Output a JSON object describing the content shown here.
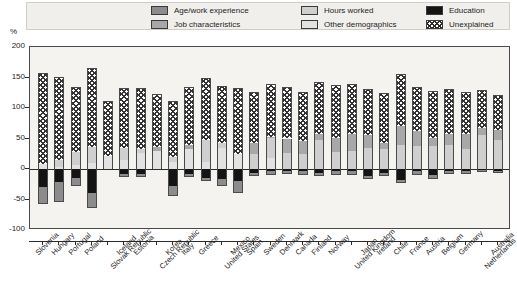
{
  "axis": {
    "unit_label": "%",
    "y_ticks": [
      "200",
      "150",
      "100",
      "50",
      "0",
      "-50",
      "-100"
    ]
  },
  "legend": {
    "items": [
      {
        "key": "age",
        "label": "Age/work experience",
        "swatch": "sw-age",
        "col": 0,
        "row": 0
      },
      {
        "key": "job",
        "label": "Job characteristics",
        "swatch": "sw-job",
        "col": 0,
        "row": 1
      },
      {
        "key": "hours",
        "label": "Hours worked",
        "swatch": "sw-hours",
        "col": 1,
        "row": 0
      },
      {
        "key": "other",
        "label": "Other demographics",
        "swatch": "sw-other",
        "col": 1,
        "row": 1
      },
      {
        "key": "education",
        "label": "Education",
        "swatch": "sw-edu",
        "col": 2,
        "row": 0
      },
      {
        "key": "unexplained",
        "label": "Unexplained",
        "swatch": "sw-unex",
        "col": 2,
        "row": 1
      }
    ]
  },
  "colors": {
    "age": "#8c8c8c",
    "job": "#a8a8a8",
    "hours": "#cfcfcf",
    "other": "#e2e2e2",
    "education": "#141414",
    "unexplained": "#ffffff",
    "plot_background": "#f4f3f0",
    "legend_background": "#f0efec",
    "axis": "#2b2b2b"
  },
  "chart_data": {
    "type": "bar",
    "stacked": true,
    "title": "",
    "subtitle": "",
    "xlabel": "",
    "ylabel": "%",
    "ylim": [
      -100,
      200
    ],
    "ytick_step": 50,
    "grid": false,
    "legend_position": "top",
    "series_order": [
      "age",
      "job",
      "hours",
      "other",
      "education",
      "unexplained"
    ],
    "series_labels": {
      "age": "Age/work experience",
      "job": "Job characteristics",
      "hours": "Hours worked",
      "other": "Other demographics",
      "education": "Education",
      "unexplained": "Unexplained"
    },
    "categories": [
      "Slovenia",
      "Hungary",
      "Portugal",
      "Poland",
      "Slovak Republic",
      "Iceland",
      "Estonia",
      "Czech Republic",
      "Korea",
      "Italy",
      "Greece",
      "United States",
      "Mexico",
      "Spain",
      "Sweden",
      "Denmark",
      "Canada",
      "Finland",
      "Norway",
      "United Kingdom",
      "Japan",
      "Ireland",
      "Chile",
      "France",
      "Austria",
      "Belgium",
      "Germany",
      "Netherlands",
      "Australia"
    ],
    "series": [
      {
        "name": "Age/work experience",
        "key": "age",
        "values": [
          -25,
          -30,
          -12,
          -22,
          0,
          -3,
          -4,
          0,
          -14,
          -3,
          -4,
          -11,
          -18,
          -4,
          -4,
          -3,
          -4,
          -4,
          -4,
          -4,
          -3,
          -4,
          -4,
          -4,
          -4,
          -2,
          -3,
          -2,
          -2
        ]
      },
      {
        "name": "Job characteristics",
        "key": "job",
        "values": [
          0,
          0,
          0,
          0,
          0,
          0,
          0,
          6,
          0,
          8,
          0,
          0,
          0,
          18,
          2,
          24,
          22,
          10,
          23,
          27,
          21,
          10,
          30,
          24,
          13,
          17,
          26,
          12,
          16
        ]
      },
      {
        "name": "Hours worked",
        "key": "hours",
        "values": [
          0,
          10,
          22,
          26,
          0,
          20,
          6,
          0,
          8,
          0,
          35,
          8,
          0,
          24,
          33,
          26,
          24,
          48,
          28,
          30,
          35,
          33,
          40,
          38,
          38,
          40,
          32,
          56,
          48
        ]
      },
      {
        "name": "Other demographics",
        "key": "other",
        "values": [
          8,
          4,
          6,
          10,
          22,
          14,
          26,
          30,
          12,
          32,
          12,
          34,
          24,
          0,
          18,
          0,
          0,
          0,
          0,
          0,
          0,
          0,
          0,
          0,
          0,
          0,
          0,
          0,
          0
        ]
      },
      {
        "name": "Education",
        "key": "education",
        "values": [
          -30,
          -22,
          -15,
          -40,
          0,
          -8,
          -8,
          0,
          -28,
          -8,
          -14,
          -16,
          -20,
          -6,
          -4,
          -4,
          -4,
          -6,
          -4,
          -4,
          -12,
          -6,
          -18,
          -4,
          -10,
          -4,
          -4,
          -2,
          -3
        ]
      },
      {
        "name": "Unexplained",
        "key": "unexplained",
        "values": [
          150,
          137,
          106,
          129,
          90,
          98,
          100,
          87,
          92,
          95,
          103,
          94,
          108,
          85,
          87,
          84,
          80,
          84,
          87,
          83,
          75,
          82,
          86,
          72,
          77,
          74,
          68,
          62,
          58
        ]
      }
    ],
    "bar_totals_positive": [
      158,
      151,
      134,
      165,
      112,
      132,
      132,
      123,
      112,
      135,
      150,
      136,
      132,
      127,
      140,
      134,
      126,
      142,
      138,
      140,
      131,
      125,
      156,
      134,
      128,
      131,
      126,
      130,
      122
    ],
    "bar_totals_negative": [
      -55,
      -52,
      -27,
      -62,
      0,
      -11,
      -12,
      0,
      -42,
      -11,
      -18,
      -27,
      -38,
      -10,
      -8,
      -7,
      -8,
      -10,
      -8,
      -8,
      -15,
      -10,
      -22,
      -8,
      -14,
      -6,
      -7,
      -4,
      -5
    ]
  }
}
